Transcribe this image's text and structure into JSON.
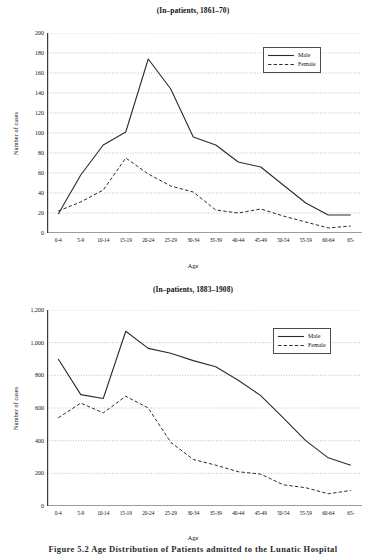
{
  "figure": {
    "caption": "Figure 5.2  Age Distribution of Patients admitted to the Lunatic Hospital"
  },
  "charts": [
    {
      "id": "chart-top",
      "title": "(In–patients, 1861–70)",
      "xlabel": "Age",
      "ylabel": "Number of cases",
      "legend": {
        "position": "top-right",
        "items": [
          "Male",
          "Female"
        ]
      },
      "chart_data": {
        "type": "line",
        "title": "(In–patients, 1861–70)",
        "xlabel": "Age",
        "ylabel": "Number of cases",
        "categories": [
          "0-4",
          "5-9",
          "10-14",
          "15-19",
          "20-24",
          "25-29",
          "30-34",
          "35-39",
          "40-44",
          "45-49",
          "50-54",
          "55-59",
          "60-64",
          "65-"
        ],
        "series": [
          {
            "name": "Male",
            "style": "solid",
            "values": [
              19,
              58,
              88,
              101,
              174,
              144,
              96,
              88,
              71,
              66,
              48,
              30,
              18,
              18
            ]
          },
          {
            "name": "Female",
            "style": "dashed",
            "values": [
              22,
              31,
              43,
              75,
              59,
              47,
              41,
              23,
              20,
              24,
              17,
              11,
              5,
              7
            ]
          }
        ],
        "ylim": [
          0,
          200
        ],
        "yticks": [
          0,
          20,
          40,
          60,
          80,
          100,
          120,
          140,
          160,
          180,
          200
        ],
        "ytick_labels": [
          "0",
          "20",
          "40",
          "60",
          "80",
          "100",
          "120",
          "140",
          "160",
          "180",
          "200"
        ],
        "grid": true,
        "legend_position": "top-right"
      }
    },
    {
      "id": "chart-bottom",
      "title": "(In–patients, 1883–1908)",
      "xlabel": "Age",
      "ylabel": "Number of cases",
      "legend": {
        "position": "top-right",
        "items": [
          "Male",
          "Female"
        ]
      },
      "chart_data": {
        "type": "line",
        "title": "(In–patients, 1883–1908)",
        "xlabel": "Age",
        "ylabel": "Number of cases",
        "categories": [
          "0-4",
          "5-9",
          "10-14",
          "15-19",
          "20-24",
          "25-29",
          "30-34",
          "35-39",
          "40-44",
          "45-49",
          "50-54",
          "55-59",
          "60-64",
          "65-"
        ],
        "series": [
          {
            "name": "Male",
            "style": "solid",
            "values": [
              900,
              682,
              658,
              1070,
              965,
              935,
              890,
              852,
              770,
              676,
              540,
              400,
              295,
              250
            ]
          },
          {
            "name": "Female",
            "style": "dashed",
            "values": [
              540,
              630,
              570,
              672,
              600,
              390,
              285,
              250,
              210,
              195,
              130,
              112,
              75,
              95
            ]
          }
        ],
        "ylim": [
          0,
          1200
        ],
        "yticks": [
          0,
          200,
          400,
          600,
          800,
          1000,
          1200
        ],
        "ytick_labels": [
          "0",
          "200",
          "400",
          "600",
          "800",
          "1,000",
          "1,200"
        ],
        "grid": true,
        "legend_position": "top-right"
      }
    }
  ]
}
